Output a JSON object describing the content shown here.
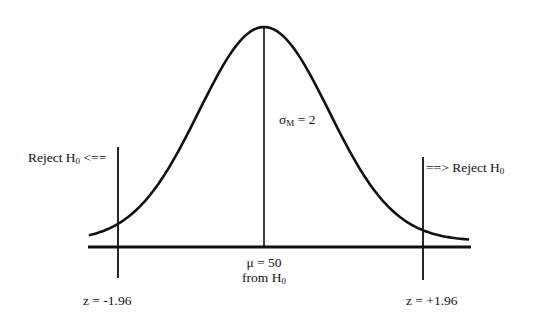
{
  "diagram": {
    "type": "normal-distribution-hypothesis-test",
    "curve": {
      "shape": "bell",
      "peak": {
        "x": 264,
        "y": 27
      },
      "baseline_y": 247,
      "tail_y": 241,
      "x_start": 90,
      "x_end": 468,
      "sigma_px": 65
    },
    "axis": {
      "x1": 88,
      "x2": 471,
      "y": 247
    },
    "mean_line": {
      "x": 264,
      "y1": 27,
      "y2": 247
    },
    "critical_lines": [
      {
        "id": "left",
        "x": 118,
        "y1": 147,
        "y2": 278
      },
      {
        "id": "right",
        "x": 423,
        "y1": 157,
        "y2": 280
      }
    ],
    "labels": {
      "reject_left": {
        "text": "Reject H",
        "sub": "0",
        "arrow": " <=="
      },
      "reject_right": {
        "arrow": "==> ",
        "text": "Reject H",
        "sub": "0"
      },
      "sigma": {
        "symbol": "σ",
        "sub": "M",
        "text": " = 2"
      },
      "mu": {
        "line1": "μ = 50",
        "line2_text": "from H",
        "line2_sub": "0"
      },
      "z_left": "z = -1.96",
      "z_right": "z = +1.96"
    },
    "colors": {
      "stroke": "#111111",
      "background": "#ffffff"
    }
  }
}
